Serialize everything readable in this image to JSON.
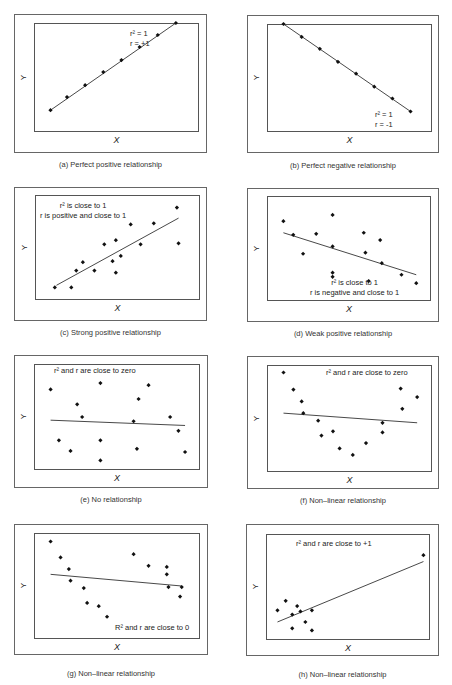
{
  "chart_data": [
    {
      "id": "a",
      "type": "scatter",
      "title": "(a) Perfect positive relationship",
      "xlabel": "X",
      "ylabel": "Y",
      "annotations": [
        "r² = 1",
        "r = +1"
      ],
      "points": [
        [
          0.1,
          0.2
        ],
        [
          0.2,
          0.32
        ],
        [
          0.31,
          0.43
        ],
        [
          0.42,
          0.55
        ],
        [
          0.53,
          0.66
        ],
        [
          0.64,
          0.78
        ],
        [
          0.75,
          0.89
        ],
        [
          0.86,
          1.0
        ]
      ],
      "fit_line": [
        [
          0.1,
          0.2
        ],
        [
          0.86,
          1.0
        ]
      ]
    },
    {
      "id": "b",
      "type": "scatter",
      "title": "(b) Perfect negative relationship",
      "xlabel": "X",
      "ylabel": "Y",
      "annotations": [
        "r² = 1",
        "r = -1"
      ],
      "points": [
        [
          0.1,
          1.0
        ],
        [
          0.21,
          0.88
        ],
        [
          0.32,
          0.77
        ],
        [
          0.43,
          0.65
        ],
        [
          0.54,
          0.54
        ],
        [
          0.65,
          0.42
        ],
        [
          0.76,
          0.31
        ],
        [
          0.87,
          0.19
        ]
      ],
      "fit_line": [
        [
          0.1,
          1.0
        ],
        [
          0.87,
          0.19
        ]
      ]
    },
    {
      "id": "c",
      "type": "scatter",
      "title": "(c) Strong positive relationship",
      "xlabel": "X",
      "ylabel": "Y",
      "annotations": [
        "r² is close to 1",
        "r is positive and close to 1"
      ],
      "points": [
        [
          0.12,
          0.12
        ],
        [
          0.22,
          0.12
        ],
        [
          0.25,
          0.28
        ],
        [
          0.29,
          0.36
        ],
        [
          0.36,
          0.28
        ],
        [
          0.42,
          0.53
        ],
        [
          0.47,
          0.37
        ],
        [
          0.49,
          0.57
        ],
        [
          0.49,
          0.26
        ],
        [
          0.52,
          0.42
        ],
        [
          0.58,
          0.72
        ],
        [
          0.64,
          0.53
        ],
        [
          0.72,
          0.73
        ],
        [
          0.86,
          0.88
        ],
        [
          0.87,
          0.54
        ]
      ],
      "fit_line": [
        [
          0.13,
          0.14
        ],
        [
          0.87,
          0.78
        ]
      ]
    },
    {
      "id": "d",
      "type": "scatter",
      "title": "(d) Weak positive relationship",
      "xlabel": "X",
      "ylabel": "Y",
      "annotations": [
        "r² is close to 1",
        "r is negative and close to 1"
      ],
      "points": [
        [
          0.1,
          0.76
        ],
        [
          0.16,
          0.63
        ],
        [
          0.22,
          0.45
        ],
        [
          0.3,
          0.64
        ],
        [
          0.4,
          0.82
        ],
        [
          0.4,
          0.52
        ],
        [
          0.4,
          0.27
        ],
        [
          0.4,
          0.23
        ],
        [
          0.59,
          0.65
        ],
        [
          0.6,
          0.46
        ],
        [
          0.62,
          0.19
        ],
        [
          0.69,
          0.58
        ],
        [
          0.7,
          0.36
        ],
        [
          0.82,
          0.25
        ],
        [
          0.91,
          0.17
        ]
      ],
      "fit_line": [
        [
          0.1,
          0.65
        ],
        [
          0.91,
          0.25
        ]
      ]
    },
    {
      "id": "e",
      "type": "scatter",
      "title": "(e) No relationship",
      "xlabel": "X",
      "ylabel": "Y",
      "annotations": [
        "r² and r are close to zero"
      ],
      "points": [
        [
          0.1,
          0.76
        ],
        [
          0.15,
          0.28
        ],
        [
          0.22,
          0.18
        ],
        [
          0.26,
          0.62
        ],
        [
          0.29,
          0.5
        ],
        [
          0.4,
          0.82
        ],
        [
          0.4,
          0.28
        ],
        [
          0.4,
          0.09
        ],
        [
          0.6,
          0.46
        ],
        [
          0.62,
          0.2
        ],
        [
          0.63,
          0.67
        ],
        [
          0.69,
          0.8
        ],
        [
          0.82,
          0.5
        ],
        [
          0.87,
          0.37
        ],
        [
          0.91,
          0.17
        ]
      ],
      "fit_line": [
        [
          0.1,
          0.47
        ],
        [
          0.91,
          0.42
        ]
      ]
    },
    {
      "id": "f",
      "type": "scatter",
      "title": "(f) Non–linear relationship",
      "xlabel": "X",
      "ylabel": "Y",
      "annotations": [
        "r² and r are close to zero"
      ],
      "points": [
        [
          0.1,
          0.93
        ],
        [
          0.16,
          0.77
        ],
        [
          0.21,
          0.66
        ],
        [
          0.22,
          0.55
        ],
        [
          0.31,
          0.48
        ],
        [
          0.33,
          0.34
        ],
        [
          0.4,
          0.38
        ],
        [
          0.44,
          0.22
        ],
        [
          0.52,
          0.16
        ],
        [
          0.6,
          0.27
        ],
        [
          0.7,
          0.37
        ],
        [
          0.7,
          0.46
        ],
        [
          0.81,
          0.78
        ],
        [
          0.82,
          0.59
        ],
        [
          0.91,
          0.7
        ]
      ],
      "fit_line": [
        [
          0.1,
          0.55
        ],
        [
          0.91,
          0.46
        ]
      ]
    },
    {
      "id": "g",
      "type": "scatter",
      "title": "(g) Non–linear relationship",
      "xlabel": "X",
      "ylabel": "Y",
      "annotations": [
        "R² and r are close to 0"
      ],
      "points": [
        [
          0.1,
          0.92
        ],
        [
          0.16,
          0.77
        ],
        [
          0.21,
          0.66
        ],
        [
          0.22,
          0.55
        ],
        [
          0.3,
          0.48
        ],
        [
          0.32,
          0.34
        ],
        [
          0.39,
          0.31
        ],
        [
          0.44,
          0.21
        ],
        [
          0.6,
          0.8
        ],
        [
          0.69,
          0.69
        ],
        [
          0.8,
          0.68
        ],
        [
          0.8,
          0.61
        ],
        [
          0.81,
          0.49
        ],
        [
          0.88,
          0.4
        ],
        [
          0.89,
          0.49
        ]
      ],
      "fit_line": [
        [
          0.1,
          0.61
        ],
        [
          0.89,
          0.5
        ]
      ]
    },
    {
      "id": "h",
      "type": "scatter",
      "title": "(h) Non–linear relationship",
      "xlabel": "X",
      "ylabel": "Y",
      "annotations": [
        "r² and r are close to +1"
      ],
      "points": [
        [
          0.07,
          0.28
        ],
        [
          0.12,
          0.37
        ],
        [
          0.16,
          0.24
        ],
        [
          0.16,
          0.11
        ],
        [
          0.19,
          0.32
        ],
        [
          0.21,
          0.27
        ],
        [
          0.24,
          0.17
        ],
        [
          0.28,
          0.28
        ],
        [
          0.28,
          0.09
        ],
        [
          0.96,
          0.8
        ]
      ],
      "fit_line": [
        [
          0.07,
          0.17
        ],
        [
          0.96,
          0.74
        ]
      ]
    }
  ],
  "panels": [
    {
      "caption": "(a) Perfect positive relationship",
      "xlabel": "X",
      "ylabel": "Y",
      "ann1": "r² = 1",
      "ann2": "r = +1"
    },
    {
      "caption": "(b) Perfect negative relationship",
      "xlabel": "X",
      "ylabel": "Y",
      "ann1": "r² = 1",
      "ann2": "r = -1"
    },
    {
      "caption": "(c) Strong positive relationship",
      "xlabel": "X",
      "ylabel": "Y",
      "ann1": "r² is close to 1",
      "ann2": "r is positive and close to 1"
    },
    {
      "caption": "(d) Weak positive relationship",
      "xlabel": "X",
      "ylabel": "Y",
      "ann1": "r² is close to 1",
      "ann2": "r is negative and close to 1"
    },
    {
      "caption": "(e) No relationship",
      "xlabel": "X",
      "ylabel": "Y",
      "ann1": "r² and r are close to zero",
      "ann2": ""
    },
    {
      "caption": "(f) Non–linear relationship",
      "xlabel": "X",
      "ylabel": "Y",
      "ann1": "r² and r are close to zero",
      "ann2": ""
    },
    {
      "caption": "(g) Non–linear relationship",
      "xlabel": "X",
      "ylabel": "Y",
      "ann1": "R² and r are close to 0",
      "ann2": ""
    },
    {
      "caption": "(h) Non–linear relationship",
      "xlabel": "X",
      "ylabel": "Y",
      "ann1": "r² and r are close to +1",
      "ann2": ""
    }
  ]
}
